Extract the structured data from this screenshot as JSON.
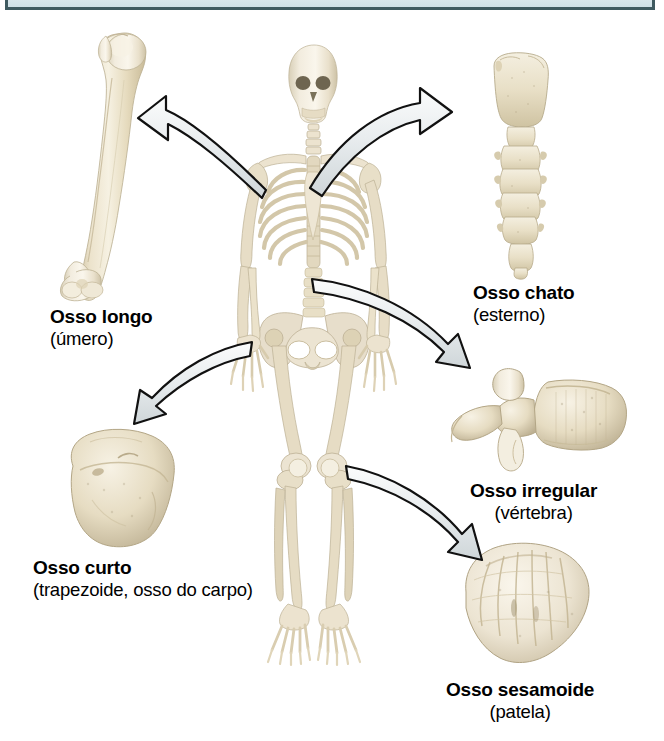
{
  "figure": {
    "language": "pt-BR",
    "background_color": "#ffffff",
    "banner_color": "#dfebef",
    "banner_border_color": "#3f5a60",
    "bone_color": "#e8dfc8",
    "arrow_fill": "#e9ecee",
    "arrow_outline": "#111111"
  },
  "labels": {
    "long_bone": {
      "title": "Osso longo",
      "subtitle": "(úmero)"
    },
    "flat_bone": {
      "title": "Osso chato",
      "subtitle": "(esterno)"
    },
    "short_bone": {
      "title": "Osso curto",
      "subtitle": "(trapezoide, osso do carpo)"
    },
    "irregular_bone": {
      "title": "Osso irregular",
      "subtitle": "(vértebra)"
    },
    "sesamoid_bone": {
      "title": "Osso sesamoide",
      "subtitle": "(patela)"
    }
  },
  "specimens": [
    {
      "id": "humerus",
      "name": "humerus-bone-illustration",
      "label_key": "long_bone"
    },
    {
      "id": "sternum",
      "name": "sternum-bone-illustration",
      "label_key": "flat_bone"
    },
    {
      "id": "trapezoid",
      "name": "trapezoid-bone-illustration",
      "label_key": "short_bone"
    },
    {
      "id": "vertebra",
      "name": "vertebra-bone-illustration",
      "label_key": "irregular_bone"
    },
    {
      "id": "patella",
      "name": "patella-bone-illustration",
      "label_key": "sesamoid_bone"
    },
    {
      "id": "skeleton",
      "name": "human-skeleton-illustration",
      "label_key": null
    }
  ],
  "arrows": [
    {
      "id": "arrow-to-humerus",
      "from": "skeleton-shoulder",
      "to": "humerus",
      "direction": "left"
    },
    {
      "id": "arrow-to-sternum",
      "from": "skeleton-sternum",
      "to": "sternum",
      "direction": "right"
    },
    {
      "id": "arrow-to-trapezoid",
      "from": "skeleton-wrist",
      "to": "trapezoid",
      "direction": "down-left"
    },
    {
      "id": "arrow-to-vertebra",
      "from": "skeleton-spine",
      "to": "vertebra",
      "direction": "down-right"
    },
    {
      "id": "arrow-to-patella",
      "from": "skeleton-knee",
      "to": "patella",
      "direction": "down-right"
    }
  ]
}
